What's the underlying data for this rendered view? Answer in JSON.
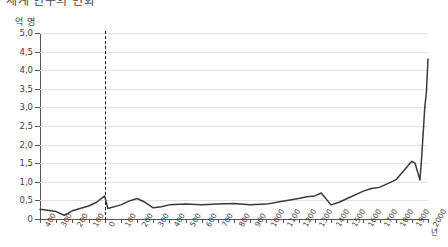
{
  "title": {
    "text": "세계 인구의 변화"
  },
  "axes": {
    "y_unit": "억 명",
    "x_unit": "년",
    "y_ticks": [
      "5,0",
      "4,5",
      "4,0",
      "3,5",
      "3,0",
      "2,5",
      "2,0",
      "1,5",
      "1,0",
      "0,5",
      "0"
    ],
    "x_ticks": [
      "400",
      "300",
      "200",
      "100",
      "0",
      "100",
      "200",
      "300",
      "400",
      "500",
      "600",
      "700",
      "800",
      "900",
      "1000",
      "1100",
      "1200",
      "1300",
      "1400",
      "1500",
      "1600",
      "1700",
      "1800",
      "1900",
      "2000"
    ]
  },
  "annotations": {
    "epoch_divider_label": "0"
  },
  "colors": {
    "line": "#3a3a3a",
    "grid": "#e2e2e2",
    "axis": "#555555",
    "divider": "#1a1a1a"
  },
  "chart_data": {
    "type": "line",
    "title": "세계 인구의 변화",
    "xlabel": "년",
    "ylabel": "억 명",
    "ylim": [
      0,
      5.0
    ],
    "xlim": [
      -400,
      2000
    ],
    "grid": true,
    "legend": null,
    "y_tick_values": [
      0,
      0.5,
      1.0,
      1.5,
      2.0,
      2.5,
      3.0,
      3.5,
      4.0,
      4.5,
      5.0
    ],
    "x_tick_values": [
      -400,
      -300,
      -200,
      -100,
      0,
      100,
      200,
      300,
      400,
      500,
      600,
      700,
      800,
      900,
      1000,
      1100,
      1200,
      1300,
      1400,
      1500,
      1600,
      1700,
      1800,
      1900,
      2000
    ],
    "series": [
      {
        "name": "세계 인구",
        "x": [
          -400,
          -300,
          -250,
          -200,
          -100,
          -50,
          0,
          20,
          100,
          150,
          200,
          250,
          300,
          350,
          400,
          500,
          600,
          700,
          800,
          900,
          1000,
          1100,
          1200,
          1250,
          1300,
          1340,
          1400,
          1450,
          1500,
          1600,
          1650,
          1700,
          1750,
          1800,
          1850,
          1900,
          1920,
          1930,
          1940,
          1950,
          1960,
          1970,
          1980,
          1990,
          2000
        ],
        "y": [
          0.26,
          0.2,
          0.1,
          0.22,
          0.35,
          0.45,
          0.62,
          0.28,
          0.38,
          0.48,
          0.55,
          0.45,
          0.3,
          0.33,
          0.38,
          0.4,
          0.38,
          0.4,
          0.42,
          0.38,
          0.4,
          0.48,
          0.55,
          0.6,
          0.62,
          0.7,
          0.38,
          0.45,
          0.55,
          0.75,
          0.82,
          0.85,
          0.95,
          1.05,
          1.3,
          1.55,
          1.5,
          1.35,
          1.2,
          1.05,
          1.6,
          2.3,
          3.0,
          3.4,
          4.3
        ]
      }
    ],
    "notes": [
      {
        "type": "vertical-dashed",
        "x": 0,
        "label": "기원 0년"
      }
    ]
  }
}
